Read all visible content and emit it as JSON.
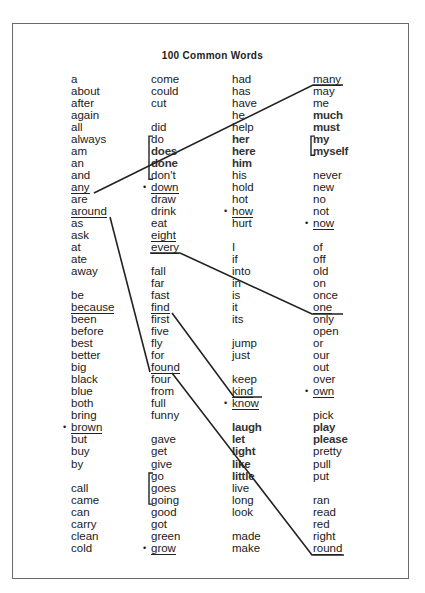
{
  "title": "100 Common Words",
  "columns": [
    {
      "x": 71,
      "words": [
        {
          "t": "a"
        },
        {
          "t": "about"
        },
        {
          "t": "after"
        },
        {
          "t": "again"
        },
        {
          "t": "all"
        },
        {
          "t": "always"
        },
        {
          "t": "am"
        },
        {
          "t": "an"
        },
        {
          "t": "and"
        },
        {
          "t": "any",
          "underline": true
        },
        {
          "t": "are"
        },
        {
          "t": "around",
          "underline": true
        },
        {
          "t": "as"
        },
        {
          "t": "ask"
        },
        {
          "t": "at"
        },
        {
          "t": "ate"
        },
        {
          "t": "away"
        },
        {
          "t": ""
        },
        {
          "t": "be"
        },
        {
          "t": "because",
          "underline": true
        },
        {
          "t": "been"
        },
        {
          "t": "before"
        },
        {
          "t": "best"
        },
        {
          "t": "better"
        },
        {
          "t": "big"
        },
        {
          "t": "black"
        },
        {
          "t": "blue"
        },
        {
          "t": "both"
        },
        {
          "t": "bring"
        },
        {
          "t": "brown",
          "bullet": true,
          "underline": true
        },
        {
          "t": "but"
        },
        {
          "t": "buy"
        },
        {
          "t": "by"
        },
        {
          "t": ""
        },
        {
          "t": "call"
        },
        {
          "t": "came"
        },
        {
          "t": "can"
        },
        {
          "t": "carry"
        },
        {
          "t": "clean"
        },
        {
          "t": "cold"
        }
      ]
    },
    {
      "x": 151,
      "words": [
        {
          "t": "come"
        },
        {
          "t": "could"
        },
        {
          "t": "cut"
        },
        {
          "t": ""
        },
        {
          "t": "did"
        },
        {
          "t": "do",
          "bracket": "start"
        },
        {
          "t": "does",
          "bold": true
        },
        {
          "t": "done",
          "bold": true
        },
        {
          "t": "don't",
          "bracket": "end"
        },
        {
          "t": "down",
          "bullet": true,
          "underline": true
        },
        {
          "t": "draw"
        },
        {
          "t": "drink"
        },
        {
          "t": "eat"
        },
        {
          "t": "eight",
          "underline": true
        },
        {
          "t": "every",
          "underline": true
        },
        {
          "t": ""
        },
        {
          "t": "fall"
        },
        {
          "t": "far"
        },
        {
          "t": "fast"
        },
        {
          "t": "find",
          "underline": true
        },
        {
          "t": "first"
        },
        {
          "t": "five"
        },
        {
          "t": "fly"
        },
        {
          "t": "for"
        },
        {
          "t": "found",
          "underline": true
        },
        {
          "t": "four"
        },
        {
          "t": "from"
        },
        {
          "t": "full"
        },
        {
          "t": "funny"
        },
        {
          "t": ""
        },
        {
          "t": "gave"
        },
        {
          "t": "get"
        },
        {
          "t": "give"
        },
        {
          "t": "go",
          "bracket": "start"
        },
        {
          "t": "goes"
        },
        {
          "t": "going",
          "bracket": "end"
        },
        {
          "t": "good"
        },
        {
          "t": "got"
        },
        {
          "t": "green"
        },
        {
          "t": "grow",
          "bullet": true,
          "underline": true
        }
      ]
    },
    {
      "x": 232,
      "words": [
        {
          "t": "had"
        },
        {
          "t": "has"
        },
        {
          "t": "have"
        },
        {
          "t": "he"
        },
        {
          "t": "help"
        },
        {
          "t": "her",
          "bold": true
        },
        {
          "t": "here",
          "bold": true
        },
        {
          "t": "him",
          "bold": true
        },
        {
          "t": "his"
        },
        {
          "t": "hold"
        },
        {
          "t": "hot"
        },
        {
          "t": "how",
          "bullet": true,
          "underline": true
        },
        {
          "t": "hurt"
        },
        {
          "t": ""
        },
        {
          "t": "I"
        },
        {
          "t": "if"
        },
        {
          "t": "into"
        },
        {
          "t": "in"
        },
        {
          "t": "is"
        },
        {
          "t": "it"
        },
        {
          "t": "its"
        },
        {
          "t": ""
        },
        {
          "t": "jump"
        },
        {
          "t": "just"
        },
        {
          "t": ""
        },
        {
          "t": "keep"
        },
        {
          "t": "kind",
          "underline": true
        },
        {
          "t": "know",
          "bullet": true,
          "underline": true
        },
        {
          "t": ""
        },
        {
          "t": "laugh",
          "bold": true
        },
        {
          "t": "let",
          "bold": true
        },
        {
          "t": "light",
          "bold": true
        },
        {
          "t": "like",
          "bold": true
        },
        {
          "t": "little",
          "bold": true
        },
        {
          "t": "live"
        },
        {
          "t": "long"
        },
        {
          "t": "look"
        },
        {
          "t": ""
        },
        {
          "t": "made"
        },
        {
          "t": "make"
        }
      ]
    },
    {
      "x": 313,
      "words": [
        {
          "t": "many",
          "underline": true
        },
        {
          "t": "may"
        },
        {
          "t": "me"
        },
        {
          "t": "much",
          "bold": true
        },
        {
          "t": "must",
          "bold": true
        },
        {
          "t": "my",
          "bold": true,
          "bracket": "start"
        },
        {
          "t": "myself",
          "bold": true,
          "bracket": "end"
        },
        {
          "t": ""
        },
        {
          "t": "never"
        },
        {
          "t": "new"
        },
        {
          "t": "no"
        },
        {
          "t": "not"
        },
        {
          "t": "now",
          "bullet": true,
          "underline": true
        },
        {
          "t": ""
        },
        {
          "t": "of"
        },
        {
          "t": "off"
        },
        {
          "t": "old"
        },
        {
          "t": "on"
        },
        {
          "t": "once"
        },
        {
          "t": "one",
          "underline": true
        },
        {
          "t": "only"
        },
        {
          "t": "open"
        },
        {
          "t": "or"
        },
        {
          "t": "our"
        },
        {
          "t": "out"
        },
        {
          "t": "over"
        },
        {
          "t": "own",
          "bullet": true,
          "underline": true
        },
        {
          "t": ""
        },
        {
          "t": "pick"
        },
        {
          "t": "play",
          "bold": true
        },
        {
          "t": "please",
          "bold": true
        },
        {
          "t": "pretty"
        },
        {
          "t": "pull"
        },
        {
          "t": "put"
        },
        {
          "t": ""
        },
        {
          "t": "ran"
        },
        {
          "t": "read"
        },
        {
          "t": "red"
        },
        {
          "t": "right"
        },
        {
          "t": "round",
          "underline": true
        }
      ]
    }
  ],
  "connector_lines": [
    {
      "from": "any",
      "to": "many",
      "x1": 94,
      "y1": 193,
      "x2": 313,
      "y2": 85,
      "x3": 343,
      "y3": 85
    },
    {
      "from": "around",
      "to": "found",
      "x1": 110,
      "y1": 217,
      "x2": 150,
      "y2": 372
    },
    {
      "from": "every",
      "to": "one",
      "x1": 150,
      "y1": 253,
      "x2": 180,
      "y2": 253,
      "x3": 312,
      "y3": 314,
      "x4": 343,
      "y4": 314
    },
    {
      "from": "find",
      "to": "know",
      "x1": 172,
      "y1": 313,
      "x2": 234,
      "y2": 397,
      "x3": 262,
      "y3": 397
    },
    {
      "from": "found",
      "to": "round",
      "x1": 172,
      "y1": 373,
      "x2": 312,
      "y2": 555,
      "x3": 344,
      "y3": 555
    }
  ]
}
